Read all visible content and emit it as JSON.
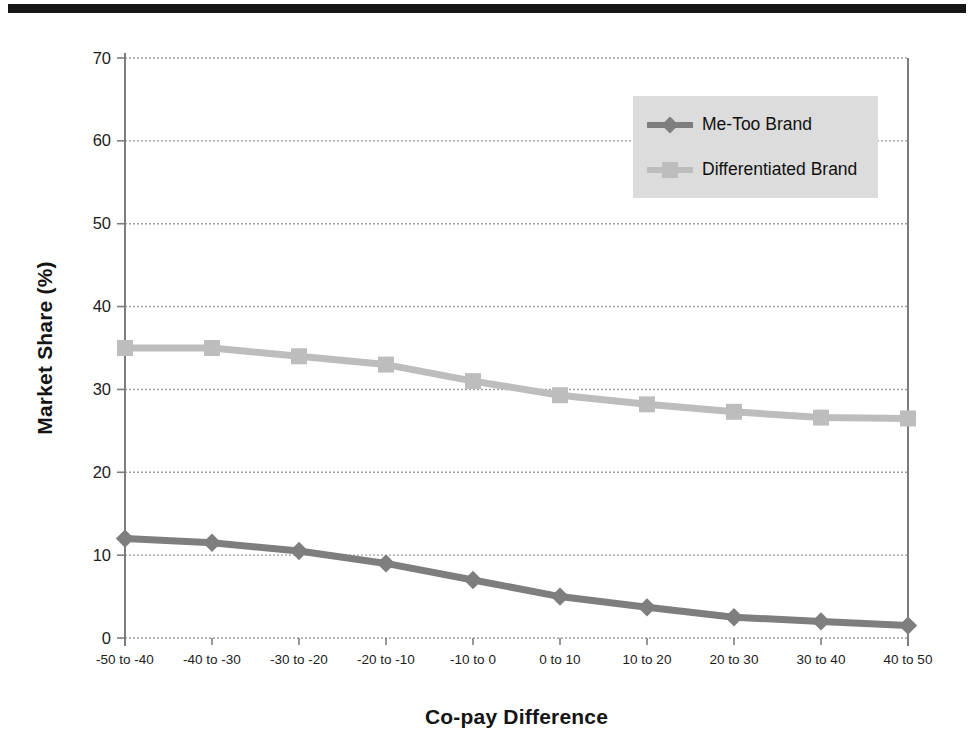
{
  "figure": {
    "background_color": "#ffffff",
    "top_bar_color": "#161616"
  },
  "chart_data": {
    "type": "line",
    "title": "",
    "xlabel": "Co-pay Difference",
    "ylabel": "Market Share (%)",
    "categories": [
      "-50 to -40",
      "-40 to -30",
      "-30 to -20",
      "-20 to -10",
      "-10 to 0",
      "0 to 10",
      "10 to 20",
      "20 to 30",
      "30 to 40",
      "40 to 50"
    ],
    "series": [
      {
        "name": "Me-Too Brand",
        "marker": "diamond",
        "color": "#7e7e7e",
        "values": [
          12,
          11.5,
          10.5,
          9,
          7,
          5,
          3.7,
          2.5,
          2,
          1.5
        ]
      },
      {
        "name": "Differentiated Brand",
        "marker": "square",
        "color": "#bdbdbd",
        "values": [
          35,
          35,
          34,
          33,
          31,
          29.3,
          28.2,
          27.3,
          26.6,
          26.5
        ]
      }
    ],
    "ylim": [
      0,
      70
    ],
    "yticks": [
      0,
      10,
      20,
      30,
      40,
      50,
      60,
      70
    ],
    "grid": "horizontal dashed gridlines at every 10 units",
    "legend_position": "top-right inside plot",
    "colors": {
      "gridline": "#9e9e9e",
      "axis": "#7d7d7d",
      "tick_label": "#1c1c1c",
      "legend_background": "#dcdcdc"
    }
  }
}
